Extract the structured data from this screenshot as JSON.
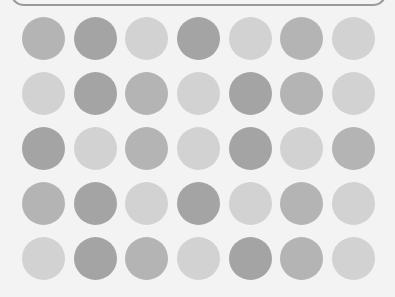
{
  "board": {
    "rows": 5,
    "cols": 7,
    "colors": {
      "dark": "#a4a4a4",
      "medium": "#b4b4b4",
      "light": "#d2d2d2"
    },
    "col_x": [
      43,
      95,
      146,
      198,
      250,
      301,
      353
    ],
    "row_y": [
      38,
      93,
      148,
      203,
      258
    ],
    "cells": [
      [
        "medium",
        "dark",
        "light",
        "dark",
        "light",
        "medium",
        "light"
      ],
      [
        "light",
        "dark",
        "medium",
        "light",
        "dark",
        "medium",
        "light"
      ],
      [
        "dark",
        "light",
        "medium",
        "light",
        "dark",
        "light",
        "medium"
      ],
      [
        "medium",
        "dark",
        "light",
        "dark",
        "light",
        "medium",
        "light"
      ],
      [
        "light",
        "dark",
        "medium",
        "light",
        "dark",
        "medium",
        "light"
      ]
    ]
  }
}
